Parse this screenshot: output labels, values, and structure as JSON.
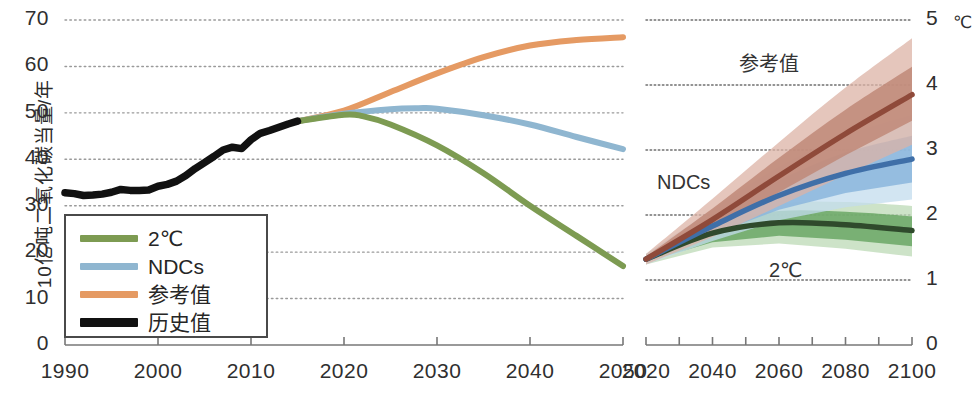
{
  "figure": {
    "y_axis_title_left": "10亿吨二氧化碳当量/年",
    "right_axis_unit": "℃"
  },
  "legend": {
    "items": [
      {
        "label": "2℃",
        "color": "#7d9b52",
        "style": "line"
      },
      {
        "label": "NDCs",
        "color": "#8fb6d0",
        "style": "line"
      },
      {
        "label": "参考值",
        "color": "#e59a63",
        "style": "line"
      },
      {
        "label": "历史值",
        "color": "#111111",
        "style": "line-thick"
      }
    ]
  },
  "annotations": {
    "reference": "参考值",
    "ndcs": "NDCs",
    "two_c": "2℃"
  },
  "chart_data": [
    {
      "type": "line",
      "id": "emissions-panel",
      "title": "",
      "xlabel": "",
      "ylabel": "10亿吨二氧化碳当量/年",
      "xlim": [
        1990,
        2050
      ],
      "ylim": [
        0,
        70
      ],
      "xticks": [
        1990,
        2000,
        2010,
        2020,
        2030,
        2040,
        2050
      ],
      "xtick_labels": [
        "1990",
        "2000",
        "2010",
        "2020",
        "2030",
        "2040",
        "2050"
      ],
      "yticks": [
        0,
        10,
        20,
        30,
        40,
        50,
        60,
        70
      ],
      "ytick_labels": [
        "0",
        "10",
        "20",
        "30",
        "40",
        "50",
        "60",
        "70"
      ],
      "grid": "horizontal-dotted",
      "legend_position": "lower-left",
      "series": [
        {
          "name": "历史值",
          "color": "#111111",
          "x": [
            1990,
            1991,
            1992,
            1993,
            1994,
            1995,
            1996,
            1997,
            1998,
            1999,
            2000,
            2001,
            2002,
            2003,
            2004,
            2005,
            2006,
            2007,
            2008,
            2009,
            2010,
            2011,
            2012,
            2013,
            2014,
            2015
          ],
          "values": [
            32.8,
            32.6,
            32.2,
            32.3,
            32.5,
            32.9,
            33.5,
            33.3,
            33.3,
            33.4,
            34.2,
            34.6,
            35.3,
            36.5,
            38.0,
            39.3,
            40.6,
            42.0,
            42.6,
            42.3,
            44.2,
            45.6,
            46.2,
            46.9,
            47.6,
            48.2
          ]
        },
        {
          "name": "参考值",
          "color": "#e59a63",
          "x": [
            2015,
            2020,
            2025,
            2030,
            2035,
            2040,
            2045,
            2050
          ],
          "values": [
            48.2,
            50.5,
            54.5,
            58.5,
            62.0,
            64.5,
            65.7,
            66.3
          ]
        },
        {
          "name": "NDCs",
          "color": "#8fb6d0",
          "x": [
            2015,
            2020,
            2025,
            2028,
            2030,
            2035,
            2040,
            2045,
            2050
          ],
          "values": [
            48.2,
            49.8,
            50.8,
            51.0,
            50.9,
            49.5,
            47.5,
            44.8,
            42.2
          ]
        },
        {
          "name": "2℃",
          "color": "#7d9b52",
          "x": [
            2015,
            2020,
            2022,
            2025,
            2030,
            2035,
            2040,
            2045,
            2050
          ],
          "values": [
            48.2,
            49.6,
            49.3,
            47.5,
            43.0,
            37.0,
            30.0,
            23.5,
            17.0
          ]
        }
      ]
    },
    {
      "type": "line",
      "id": "temperature-panel",
      "title": "",
      "xlabel": "",
      "ylabel": "℃",
      "xlim": [
        2020,
        2100
      ],
      "ylim": [
        0,
        5
      ],
      "xticks": [
        2020,
        2030,
        2040,
        2050,
        2060,
        2070,
        2080,
        2090,
        2100
      ],
      "xtick_labels": [
        "2020",
        "",
        "2040",
        "",
        "2060",
        "",
        "2080",
        "",
        "2100"
      ],
      "yticks": [
        0,
        1,
        2,
        3,
        4,
        5
      ],
      "ytick_labels": [
        "0",
        "1",
        "2",
        "3",
        "4",
        "5"
      ],
      "grid": "horizontal-dotted",
      "legend_position": "inline-annotations",
      "series": [
        {
          "name": "参考值",
          "color": "#8f4a3a",
          "band_inner_color": "#c08878",
          "band_outer_color": "#dcb3a5",
          "x": [
            2020,
            2040,
            2060,
            2080,
            2100
          ],
          "values": [
            1.32,
            1.93,
            2.6,
            3.25,
            3.85
          ],
          "band_inner_low": [
            1.28,
            1.78,
            2.35,
            2.92,
            3.45
          ],
          "band_inner_high": [
            1.36,
            2.1,
            2.88,
            3.62,
            4.28
          ],
          "band_outer_low": [
            1.24,
            1.66,
            2.14,
            2.62,
            3.08
          ],
          "band_outer_high": [
            1.4,
            2.25,
            3.12,
            3.96,
            4.72
          ]
        },
        {
          "name": "NDCs",
          "color": "#3f6fa8",
          "band_inner_color": "#8bb6dd",
          "band_outer_color": "#c3dcee",
          "x": [
            2020,
            2040,
            2060,
            2080,
            2100
          ],
          "values": [
            1.32,
            1.83,
            2.3,
            2.64,
            2.86
          ],
          "band_inner_low": [
            1.28,
            1.7,
            2.08,
            2.34,
            2.5
          ],
          "band_inner_high": [
            1.36,
            1.97,
            2.53,
            2.96,
            3.22
          ],
          "band_outer_low": [
            1.24,
            1.6,
            1.92,
            2.12,
            2.24
          ],
          "band_outer_high": [
            1.4,
            2.08,
            2.74,
            3.22,
            3.54
          ]
        },
        {
          "name": "2℃",
          "color": "#2f4a2c",
          "band_inner_color": "#6aa765",
          "band_outer_color": "#bcd9b5",
          "x": [
            2020,
            2040,
            2060,
            2080,
            2100
          ],
          "values": [
            1.32,
            1.72,
            1.88,
            1.85,
            1.76
          ],
          "band_inner_low": [
            1.28,
            1.58,
            1.68,
            1.62,
            1.52
          ],
          "band_inner_high": [
            1.36,
            1.86,
            2.06,
            2.05,
            1.98
          ],
          "band_outer_low": [
            1.24,
            1.5,
            1.56,
            1.48,
            1.36
          ],
          "band_outer_high": [
            1.4,
            1.94,
            2.18,
            2.2,
            2.14
          ]
        }
      ]
    }
  ]
}
